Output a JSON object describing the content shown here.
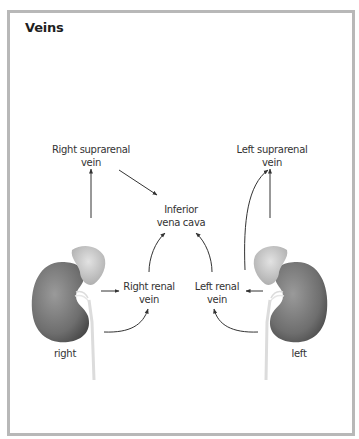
{
  "title": "Veins",
  "labels": {
    "right_suprarenal": [
      "Right suprarenal",
      "vein"
    ],
    "left_suprarenal": [
      "Left suprarenal",
      "vein"
    ],
    "ivc": [
      "Inferior",
      "vena cava"
    ],
    "right_renal": [
      "Right renal",
      "vein"
    ],
    "left_renal": [
      "Left renal",
      "vein"
    ],
    "right": "right",
    "left": "left"
  },
  "colors": {
    "border": "#b8b8b8",
    "text": "#333333",
    "arrow": "#333333",
    "kidney": "#7a7a7a",
    "adrenal": "#cfcfcf"
  }
}
